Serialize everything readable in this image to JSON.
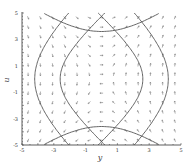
{
  "chart_data": {
    "type": "direction_field",
    "title": "",
    "xlabel": "y",
    "ylabel": "u",
    "xlim": [
      -5,
      5
    ],
    "ylim": [
      -5,
      5
    ],
    "x_ticks": [
      -5,
      -3,
      -1,
      1,
      3,
      5
    ],
    "y_ticks": [
      -5,
      -3,
      -1,
      1,
      3,
      5
    ],
    "x_tick_labels": [
      "-5",
      "-3",
      "-1",
      "1",
      "3",
      "5"
    ],
    "y_tick_labels": [
      "-5",
      "-3",
      "-1",
      "1",
      "3",
      "5"
    ],
    "grid": false,
    "legend": null,
    "field_grid": {
      "nx": 13,
      "ny": 14
    },
    "system": "saddle: trajectories are hyperbolas opening left/right (|y| grows) and up/down near center",
    "trajectories": [
      {
        "name": "left-hyperbola-outer",
        "family": "vertical",
        "vertex": [
          -4.2,
          0
        ]
      },
      {
        "name": "left-hyperbola-inner",
        "family": "vertical",
        "vertex": [
          -2.6,
          0
        ]
      },
      {
        "name": "right-hyperbola-inner",
        "family": "vertical",
        "vertex": [
          2.6,
          0
        ]
      },
      {
        "name": "right-hyperbola-outer",
        "family": "vertical",
        "vertex": [
          4.2,
          0
        ]
      },
      {
        "name": "top-hyperbola",
        "family": "horizontal",
        "vertex": [
          0,
          3.6
        ]
      },
      {
        "name": "bottom-hyperbola",
        "family": "horizontal",
        "vertex": [
          0,
          -3.6
        ]
      }
    ],
    "colors": {
      "curve": "#555555",
      "arrow": "#777777",
      "axis": "#333333"
    }
  },
  "axes": {
    "x_label": "y",
    "y_label": "u"
  }
}
